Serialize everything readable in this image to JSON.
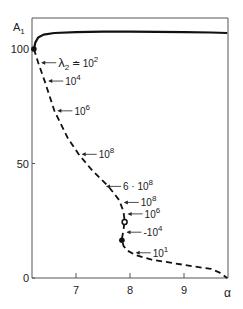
{
  "chart_data": {
    "type": "line",
    "title": "",
    "xlabel": "α",
    "ylabel": "A1",
    "ylabel_main": "A",
    "ylabel_sub": "1",
    "xlim": [
      6.2,
      9.8
    ],
    "ylim": [
      0,
      113
    ],
    "x_ticks": [
      7,
      8,
      9
    ],
    "x_tick_labels": [
      "7",
      "8",
      "9"
    ],
    "y_ticks": [
      0,
      50,
      100
    ],
    "y_tick_labels": [
      "0",
      "50",
      "100"
    ],
    "grid": false,
    "series": [
      {
        "name": "stable branch",
        "style": "solid",
        "x": [
          6.22,
          6.25,
          6.3,
          6.4,
          6.6,
          7.0,
          7.5,
          8.0,
          8.5,
          9.0,
          9.5,
          9.8
        ],
        "y": [
          100,
          103,
          105,
          106.3,
          107,
          107.4,
          107.6,
          107.6,
          107.5,
          107.4,
          107.2,
          107
        ]
      },
      {
        "name": "unstable branch",
        "style": "dashed",
        "x": [
          6.22,
          6.3,
          6.42,
          6.6,
          6.85,
          7.05,
          7.3,
          7.6,
          7.8,
          7.88,
          7.9,
          7.88,
          7.85,
          7.88,
          7.95,
          8.1,
          8.4,
          8.8,
          9.2,
          9.5,
          9.65,
          9.8
        ],
        "y": [
          100,
          94,
          86,
          73,
          61,
          54,
          47,
          40,
          34,
          29,
          25,
          21,
          17,
          14,
          12,
          10,
          8,
          6.5,
          5,
          4,
          2.5,
          0
        ]
      }
    ],
    "markers": [
      {
        "name": "start-point",
        "x": 6.22,
        "y": 100,
        "shape": "filled-dot"
      },
      {
        "name": "open-circle",
        "x": 7.9,
        "y": 24.5,
        "shape": "open-circle"
      },
      {
        "name": "dot-point",
        "x": 7.85,
        "y": 16.5,
        "shape": "filled-dot"
      }
    ],
    "annotations": [
      {
        "text_main": "λ",
        "text_sub": "2",
        "text_rest": " ≐ 10",
        "text_sup": "2",
        "x": 6.3,
        "y": 94
      },
      {
        "text_main": "10",
        "text_sup": "4",
        "x": 6.43,
        "y": 86
      },
      {
        "text_main": "10",
        "text_sup": "6",
        "x": 6.6,
        "y": 73
      },
      {
        "text_main": "10",
        "text_sup": "8",
        "x": 7.05,
        "y": 54
      },
      {
        "text_main": "6 · 10",
        "text_sup": "8",
        "x": 7.5,
        "y": 40
      },
      {
        "text_main": "10",
        "text_sup": "8",
        "x": 7.83,
        "y": 33
      },
      {
        "text_main": "10",
        "text_sup": "6",
        "x": 7.9,
        "y": 28
      },
      {
        "text_main": "-10",
        "text_sup": "4",
        "x": 7.88,
        "y": 20
      },
      {
        "text_main": "10",
        "text_sup": "1",
        "x": 8.05,
        "y": 11
      }
    ]
  }
}
